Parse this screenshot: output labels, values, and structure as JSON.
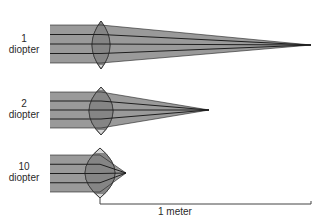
{
  "diagram": {
    "colors": {
      "beam": "#9a9a9a",
      "beam_dark": "#7a7a7a",
      "lens_fill": "#858585",
      "lens_tip": "#d4d4d4",
      "ray": "#1e1e1e",
      "outline": "#333333"
    },
    "lenses": [
      {
        "power_number": "1",
        "power_unit": "diopter",
        "focal_length_m": 1.0,
        "beam": {
          "x_start": 50,
          "y_top": 25,
          "y_bottom": 63
        },
        "lens": {
          "cx": 101,
          "cy": 45,
          "half_width": 9,
          "half_height": 24
        },
        "focus": {
          "x": 311,
          "y": 45
        }
      },
      {
        "power_number": "2",
        "power_unit": "diopter",
        "focal_length_m": 0.5,
        "beam": {
          "x_start": 50,
          "y_top": 92,
          "y_bottom": 128
        },
        "lens": {
          "cx": 101,
          "cy": 111,
          "half_width": 12,
          "half_height": 24
        },
        "focus": {
          "x": 209,
          "y": 110
        }
      },
      {
        "power_number": "10",
        "power_unit": "diopter",
        "focal_length_m": 0.1,
        "beam": {
          "x_start": 50,
          "y_top": 155,
          "y_bottom": 192
        },
        "lens": {
          "cx": 100,
          "cy": 173,
          "half_width": 15,
          "half_height": 25
        },
        "focus": {
          "x": 126,
          "y": 173
        }
      }
    ],
    "scale_bar": {
      "label": "1 meter",
      "x_start": 100,
      "x_end": 311,
      "y": 204
    }
  }
}
